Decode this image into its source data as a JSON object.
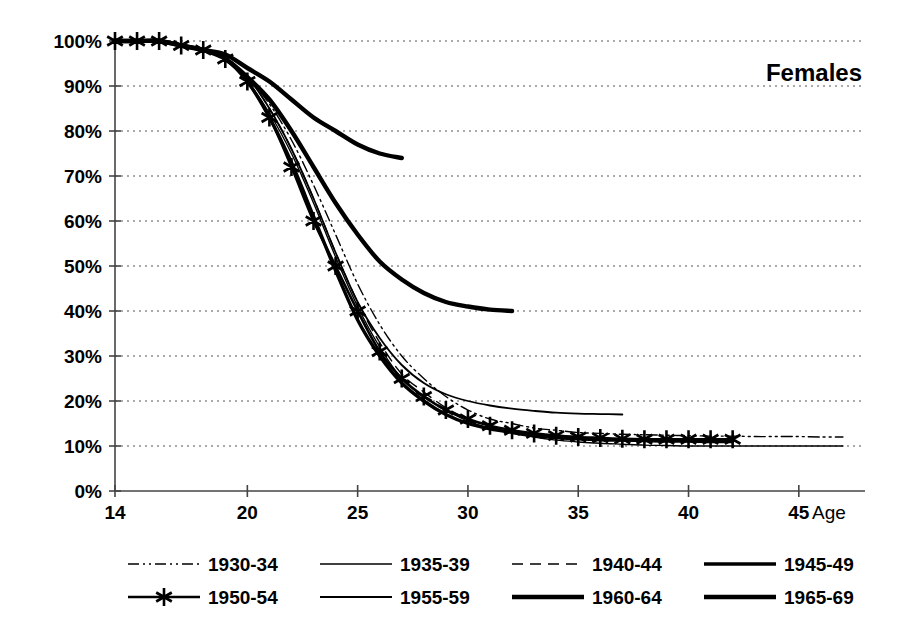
{
  "chart_data": {
    "type": "line",
    "title": "Females",
    "xlabel": "Age",
    "ylabel": "",
    "xlim": [
      14,
      48
    ],
    "ylim": [
      0,
      100
    ],
    "grid": true,
    "legend_position": "bottom",
    "x_ticks": [
      "14",
      "20",
      "25",
      "30",
      "35",
      "40",
      "45"
    ],
    "x_tick_values": [
      14,
      20,
      25,
      30,
      35,
      40,
      45
    ],
    "y_ticks": [
      "0%",
      "10%",
      "20%",
      "30%",
      "40%",
      "50%",
      "60%",
      "70%",
      "80%",
      "90%",
      "100%"
    ],
    "y_tick_values": [
      0,
      10,
      20,
      30,
      40,
      50,
      60,
      70,
      80,
      90,
      100
    ],
    "axis_unit": "percent",
    "series": [
      {
        "name": "1930-34",
        "style": "dash-dot-dot",
        "width": 1.4,
        "marker": "none",
        "x": [
          14,
          15,
          16,
          17,
          18,
          19,
          20,
          21,
          22,
          23,
          24,
          25,
          26,
          27,
          28,
          29,
          30,
          31,
          32,
          33,
          34,
          35,
          36,
          37,
          38,
          39,
          40,
          41,
          42,
          43,
          44,
          45,
          46,
          47
        ],
        "values": [
          100,
          100,
          100,
          99,
          98,
          96,
          92,
          86,
          78,
          68,
          57,
          46,
          37,
          30,
          25,
          21,
          18,
          16,
          15,
          14,
          13.5,
          13,
          12.8,
          12.6,
          12.5,
          12.4,
          12.3,
          12.2,
          12.2,
          12.1,
          12.1,
          12.1,
          12,
          12
        ]
      },
      {
        "name": "1935-39",
        "style": "solid",
        "width": 1.4,
        "marker": "none",
        "x": [
          14,
          15,
          16,
          17,
          18,
          19,
          20,
          21,
          22,
          23,
          24,
          25,
          26,
          27,
          28,
          29,
          30,
          31,
          32,
          33,
          34,
          35,
          36,
          37,
          38,
          39,
          40,
          41,
          42,
          43,
          44,
          45,
          46,
          47
        ],
        "values": [
          100,
          100,
          100,
          99,
          98,
          96,
          91,
          84,
          75,
          64,
          52,
          41,
          32,
          25,
          21,
          18,
          15.5,
          14,
          13,
          12,
          11.3,
          10.9,
          10.6,
          10.4,
          10.2,
          10.1,
          10,
          10,
          10,
          10,
          10,
          10,
          10,
          10
        ]
      },
      {
        "name": "1940-44",
        "style": "dashed",
        "width": 1.4,
        "marker": "none",
        "x": [
          14,
          15,
          16,
          17,
          18,
          19,
          20,
          21,
          22,
          23,
          24,
          25,
          26,
          27,
          28,
          29,
          30,
          31,
          32,
          33,
          34,
          35,
          36,
          37,
          38,
          39,
          40,
          41,
          42
        ],
        "values": [
          100,
          100,
          100,
          99,
          98,
          96,
          92,
          85,
          76,
          65,
          53,
          42,
          33,
          26,
          22,
          18.5,
          16,
          14.5,
          13.5,
          12.7,
          12.2,
          11.8,
          11.5,
          11.3,
          11.2,
          11.1,
          11,
          11,
          11
        ]
      },
      {
        "name": "1945-49",
        "style": "solid",
        "width": 3.4,
        "marker": "none",
        "x": [
          14,
          15,
          16,
          17,
          18,
          19,
          20,
          21,
          22,
          23,
          24,
          25,
          26,
          27,
          28,
          29,
          30,
          31,
          32,
          33,
          34,
          35,
          36,
          37,
          38,
          39,
          40,
          41,
          42
        ],
        "values": [
          100,
          100,
          100,
          99,
          98,
          96,
          91,
          83,
          73,
          61,
          49,
          38,
          30,
          24,
          20,
          17,
          15,
          13.8,
          13,
          12.3,
          11.9,
          11.6,
          11.4,
          11.3,
          11.2,
          11.1,
          11.1,
          11,
          11
        ]
      },
      {
        "name": "1950-54",
        "style": "solid",
        "width": 2.6,
        "marker": "star",
        "x": [
          14,
          15,
          16,
          17,
          18,
          19,
          20,
          21,
          22,
          23,
          24,
          25,
          26,
          27,
          28,
          29,
          30,
          31,
          32,
          33,
          34,
          35,
          36,
          37,
          38,
          39,
          40,
          41,
          42
        ],
        "values": [
          100,
          100,
          100,
          99,
          98,
          96,
          91,
          83,
          72,
          60,
          50,
          40,
          31,
          25,
          21,
          18,
          16,
          14.5,
          13.5,
          12.8,
          12.3,
          12,
          11.8,
          11.6,
          11.5,
          11.5,
          11.5,
          11.5,
          11.5
        ]
      },
      {
        "name": "1955-59",
        "style": "solid",
        "width": 1.8,
        "marker": "none",
        "x": [
          14,
          15,
          16,
          17,
          18,
          19,
          20,
          21,
          22,
          23,
          24,
          25,
          26,
          27,
          28,
          29,
          30,
          31,
          32,
          33,
          34,
          35,
          36,
          37
        ],
        "values": [
          100,
          100,
          100,
          99,
          98,
          96,
          92,
          85,
          76,
          65,
          53,
          42,
          34,
          28,
          24,
          21.5,
          20,
          19,
          18.3,
          17.8,
          17.4,
          17.2,
          17.1,
          17
        ]
      },
      {
        "name": "1960-64",
        "style": "solid",
        "width": 4.4,
        "marker": "none",
        "x": [
          14,
          15,
          16,
          17,
          18,
          19,
          20,
          21,
          22,
          23,
          24,
          25,
          26,
          27,
          28,
          29,
          30,
          31,
          32
        ],
        "values": [
          100,
          100,
          100,
          99,
          98,
          96,
          92,
          87,
          80,
          72,
          64,
          57,
          51,
          47,
          44,
          42,
          41,
          40.3,
          40
        ]
      },
      {
        "name": "1965-69",
        "style": "solid",
        "width": 4.4,
        "marker": "none",
        "x": [
          14,
          15,
          16,
          17,
          18,
          19,
          20,
          21,
          22,
          23,
          24,
          25,
          26,
          27
        ],
        "values": [
          100,
          100,
          100,
          99,
          98,
          97,
          94,
          91,
          87,
          83,
          80,
          77,
          75,
          74
        ]
      }
    ],
    "legend": [
      {
        "label": "1930-34"
      },
      {
        "label": "1935-39"
      },
      {
        "label": "1940-44"
      },
      {
        "label": "1945-49"
      },
      {
        "label": "1950-54"
      },
      {
        "label": "1955-59"
      },
      {
        "label": "1960-64"
      },
      {
        "label": "1965-69"
      }
    ]
  }
}
